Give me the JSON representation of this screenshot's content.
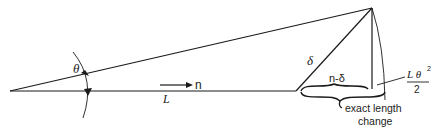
{
  "diagram": {
    "labels": {
      "theta": "θ",
      "n_arrow": "n",
      "L": "L",
      "delta": "δ",
      "n_minus_delta": "n-δ",
      "approx_num": "L θ",
      "approx_exp": "2",
      "approx_den": "2",
      "exact_line1": "exact length",
      "exact_line2": "change"
    },
    "colors": {
      "stroke": "#1a1a1a",
      "background": "#ffffff"
    }
  }
}
